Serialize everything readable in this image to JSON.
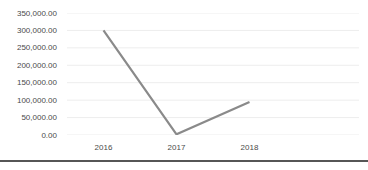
{
  "chart_data": {
    "type": "line",
    "title": "",
    "xlabel": "",
    "ylabel": "",
    "categories": [
      "2016",
      "2017",
      "2018"
    ],
    "series": [
      {
        "name": "",
        "values": [
          300000,
          2000,
          95000
        ]
      }
    ],
    "ylim": [
      0,
      350000
    ],
    "y_ticks": [
      350000,
      300000,
      250000,
      200000,
      150000,
      100000,
      50000,
      0
    ],
    "y_tick_labels": [
      "350,000.00",
      "300,000.00",
      "250,000.00",
      "200,000.00",
      "150,000.00",
      "100,000.00",
      "50,000.00",
      "0.00"
    ],
    "grid": true,
    "legend": false,
    "category_slots": 4
  },
  "colors": {
    "series_line": "#8a8a8a",
    "gridline": "#ededed",
    "tick_label": "#4a4a4a",
    "divider": "#565656",
    "background": "#ffffff"
  }
}
